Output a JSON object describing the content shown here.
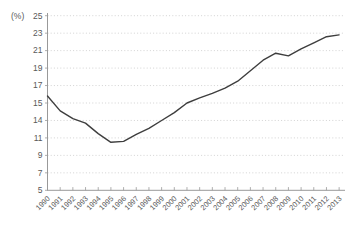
{
  "chart_data": {
    "type": "line",
    "title": "",
    "unit_label": "(%)",
    "x_categories": [
      "1990",
      "1991",
      "1992",
      "1993",
      "1994",
      "1995",
      "1996",
      "1997",
      "1998",
      "1999",
      "2000",
      "2001",
      "2002",
      "2003",
      "2004",
      "2005",
      "2006",
      "2007",
      "2008",
      "2009",
      "2010",
      "2011",
      "2012",
      "2013"
    ],
    "series": [
      {
        "name": "rate-percent",
        "values": [
          15.8,
          14.1,
          13.2,
          12.7,
          11.5,
          10.5,
          10.6,
          11.4,
          12.1,
          13.0,
          13.9,
          15.0,
          15.6,
          16.1,
          16.7,
          17.5,
          18.7,
          19.9,
          20.7,
          20.4,
          21.2,
          21.9,
          22.6,
          22.8
        ]
      }
    ],
    "y_ticks": [
      {
        "label": "25",
        "value": 25
      },
      {
        "label": "23",
        "value": 23
      },
      {
        "label": "21",
        "value": 21
      },
      {
        "label": "19",
        "value": 19
      },
      {
        "label": "17",
        "value": 17
      },
      {
        "label": "15",
        "value": 15
      },
      {
        "label": "14",
        "value": 13
      },
      {
        "label": "11",
        "value": 11
      },
      {
        "label": "9",
        "value": 9
      },
      {
        "label": "7",
        "value": 7
      },
      {
        "label": "5",
        "value": 5
      }
    ],
    "ylim": [
      5,
      25
    ],
    "grid": "dotted-horizontal",
    "legend": "none",
    "colors": {
      "line": "#3e3e3e",
      "axis": "#999999",
      "grid": "#c8c8c8",
      "tick_text": "#595959"
    }
  }
}
